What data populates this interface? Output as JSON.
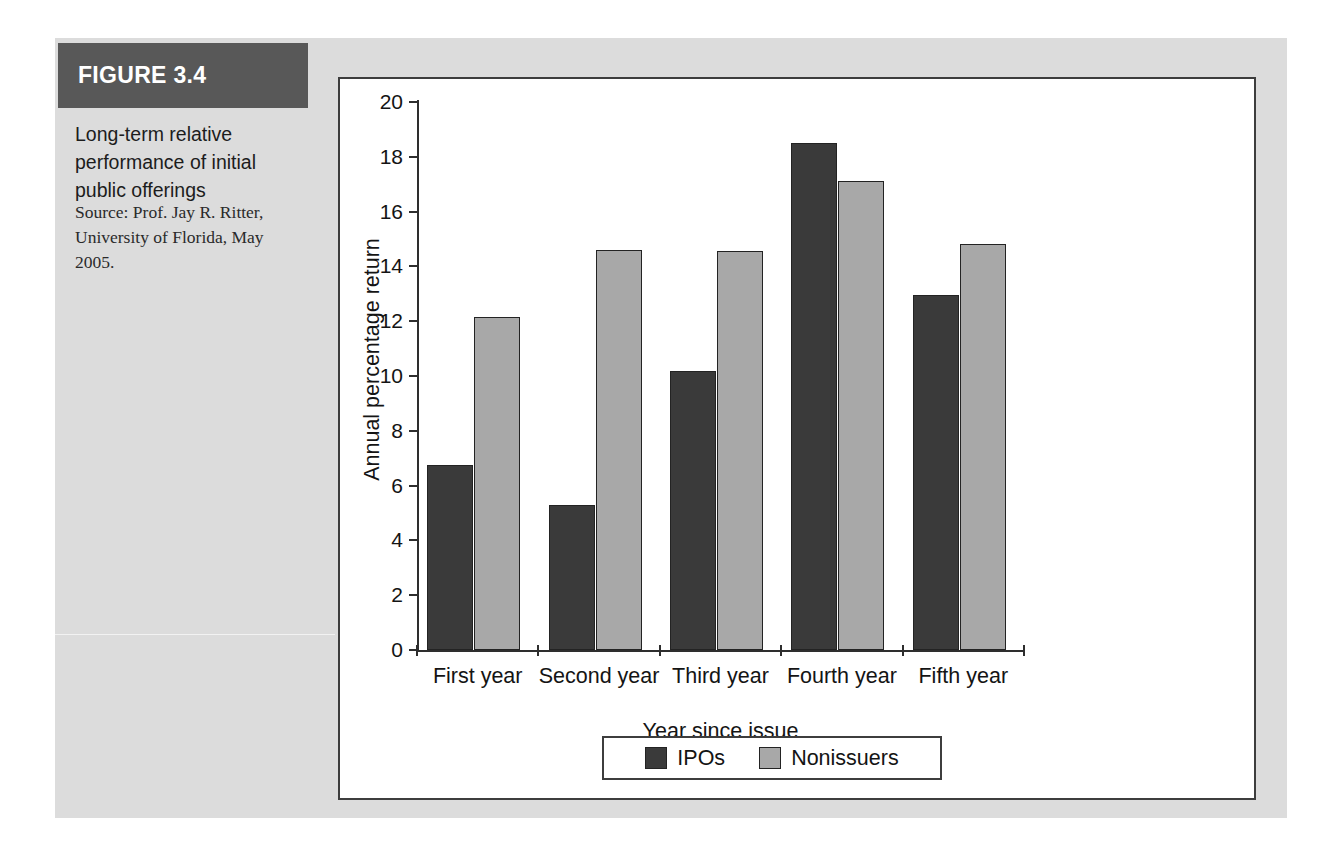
{
  "figure": {
    "banner_label": "FIGURE 3.4",
    "caption": "Long-term relative performance of initial public offerings",
    "source": "Source: Prof. Jay R. Ritter, University of Florida, May 2005.",
    "banner_color": "#585858",
    "panel_color": "#dcdcdc"
  },
  "chart_data": {
    "type": "bar",
    "title": "",
    "categories": [
      "First year",
      "Second year",
      "Third year",
      "Fourth year",
      "Fifth year"
    ],
    "series": [
      {
        "name": "IPOs",
        "color": "#3a3a3a",
        "values": [
          6.75,
          5.3,
          10.2,
          18.5,
          12.95
        ]
      },
      {
        "name": "Nonissuers",
        "color": "#a8a8a8",
        "values": [
          12.15,
          14.6,
          14.55,
          17.1,
          14.8
        ]
      }
    ],
    "xlabel": "Year since issue",
    "ylabel": "Annual percentage return",
    "ylim": [
      0,
      20
    ],
    "ytick_step": 2,
    "yticks": [
      0,
      2,
      4,
      6,
      8,
      10,
      12,
      14,
      16,
      18,
      20
    ],
    "ytick_labels": [
      "0",
      "2",
      "4",
      "6",
      "8",
      "10",
      "12",
      "14",
      "16",
      "18",
      "20"
    ],
    "grid": false,
    "legend_position": "bottom"
  }
}
